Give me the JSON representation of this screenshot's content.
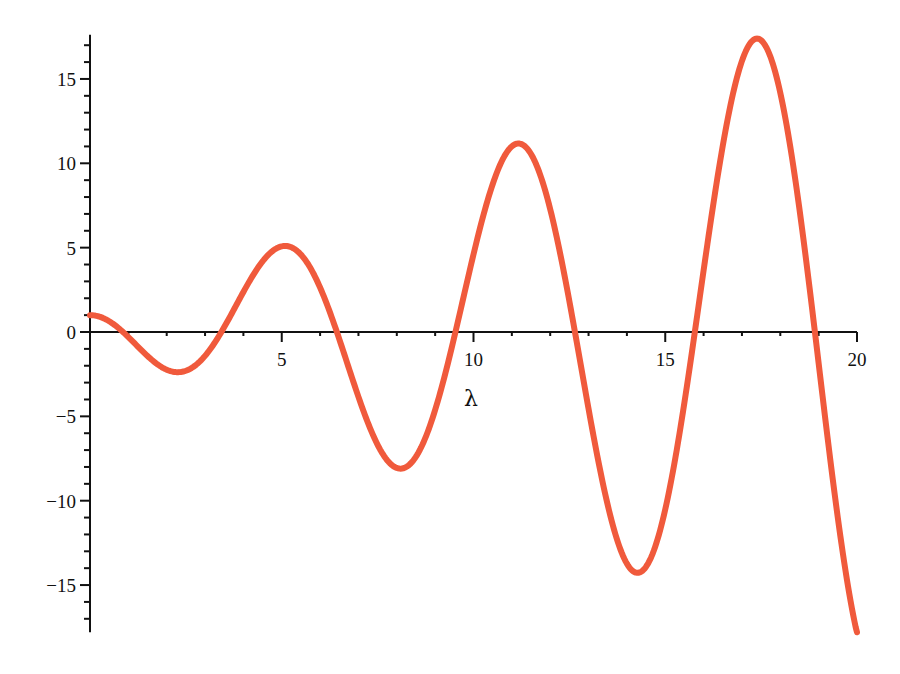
{
  "chart_data": {
    "type": "line",
    "title": "",
    "xlabel": "λ",
    "ylabel": "",
    "xlim": [
      0,
      20
    ],
    "ylim": [
      -17.8,
      17.5
    ],
    "grid": false,
    "legend": null,
    "x_ticks": [
      5,
      10,
      15,
      20
    ],
    "x_tick_labels": [
      "5",
      "10",
      "15",
      "20"
    ],
    "y_ticks": [
      -15,
      -10,
      -5,
      0,
      5,
      10,
      15
    ],
    "y_tick_labels": [
      "−15",
      "−10",
      "−5",
      "0",
      "5",
      "10",
      "15"
    ],
    "series": [
      {
        "name": "f(λ) = cos(λ) − λ·sin(λ)",
        "color": "#f05a3c",
        "x": [
          0,
          0.5,
          0.86,
          1.5,
          2.2,
          3,
          3.43,
          4,
          5.09,
          6,
          6.44,
          7,
          8.1,
          9,
          9.53,
          10,
          11.17,
          12,
          12.65,
          13,
          14.24,
          15,
          15.77,
          16,
          17.34,
          18,
          18.9,
          19.5,
          20
        ],
        "values": [
          1,
          0.64,
          0,
          -1.43,
          -2.37,
          -1.41,
          0,
          2.37,
          5.26,
          2.64,
          0,
          -3.84,
          -8.03,
          -3.8,
          0,
          4.6,
          11.1,
          7.28,
          0,
          -5.1,
          -14.1,
          -9.26,
          0,
          4.6,
          17.4,
          13.52,
          0,
          -10.4,
          -17.85
        ]
      }
    ]
  },
  "axes": {
    "x_label": "λ",
    "origin_y_label": "0"
  },
  "colors": {
    "curve": "#f05a3c",
    "axis": "#111111",
    "background": "#ffffff"
  }
}
